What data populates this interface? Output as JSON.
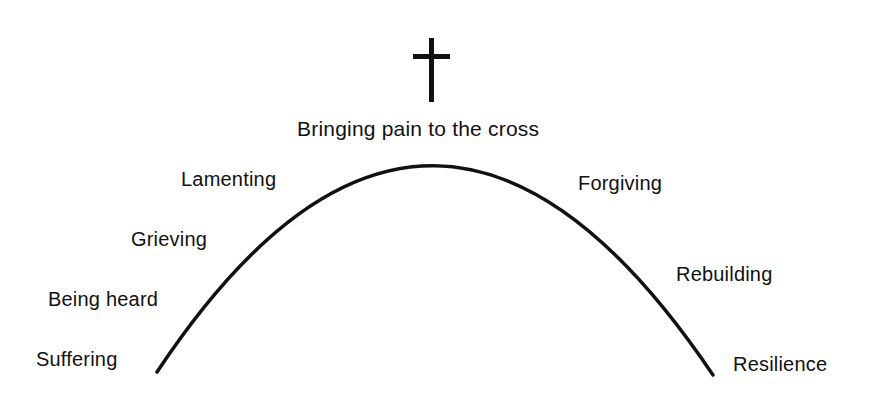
{
  "diagram": {
    "title": "Bringing pain to the cross",
    "icon": "cross-icon",
    "stroke_color": "#111111",
    "background": "#ffffff",
    "left_stages": [
      "Suffering",
      "Being heard",
      "Grieving",
      "Lamenting"
    ],
    "right_stages": [
      "Forgiving",
      "Rebuilding",
      "Resilience"
    ]
  }
}
